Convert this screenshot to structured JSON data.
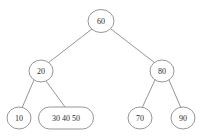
{
  "diagram": {
    "type": "tree",
    "canvas": {
      "width": 205,
      "height": 137
    },
    "colors": {
      "background": "#ffffff",
      "stroke": "#8a8a8a",
      "node_fill": "#ffffff",
      "text": "#2b2b2b"
    },
    "nodes": [
      {
        "id": "root",
        "shape": "circle",
        "label": "60",
        "keys": [
          "60"
        ],
        "cx": 101,
        "cy": 21,
        "rx": 13,
        "ry": 11.5,
        "level": 0
      },
      {
        "id": "n20",
        "shape": "circle",
        "label": "20",
        "keys": [
          "20"
        ],
        "cx": 41,
        "cy": 71,
        "rx": 12,
        "ry": 11,
        "level": 1
      },
      {
        "id": "n80",
        "shape": "circle",
        "label": "80",
        "keys": [
          "80"
        ],
        "cx": 162,
        "cy": 71,
        "rx": 12,
        "ry": 11,
        "level": 1
      },
      {
        "id": "n10",
        "shape": "circle",
        "label": "10",
        "keys": [
          "10"
        ],
        "cx": 19,
        "cy": 118,
        "rx": 12,
        "ry": 11,
        "level": 2
      },
      {
        "id": "n304050",
        "shape": "stadium",
        "label": "30  40  50",
        "keys": [
          "30",
          "40",
          "50"
        ],
        "cx": 66,
        "cy": 118,
        "rx": 27.5,
        "ry": 11,
        "level": 2
      },
      {
        "id": "n70",
        "shape": "circle",
        "label": "70",
        "keys": [
          "70"
        ],
        "cx": 140,
        "cy": 118,
        "rx": 12,
        "ry": 11,
        "level": 2
      },
      {
        "id": "n90",
        "shape": "circle",
        "label": "90",
        "keys": [
          "90"
        ],
        "cx": 183,
        "cy": 118,
        "rx": 12,
        "ry": 11,
        "level": 2
      }
    ],
    "edges": [
      {
        "id": "e-root-20",
        "from": "root",
        "to": "n20",
        "x1": 92,
        "y1": 29,
        "x2": 48,
        "y2": 63
      },
      {
        "id": "e-root-80",
        "from": "root",
        "to": "n80",
        "x1": 111,
        "y1": 29,
        "x2": 155,
        "y2": 63
      },
      {
        "id": "e-20-10",
        "from": "n20",
        "to": "n10",
        "x1": 34,
        "y1": 80,
        "x2": 22,
        "y2": 108
      },
      {
        "id": "e-20-304050",
        "from": "n20",
        "to": "n304050",
        "x1": 46,
        "y1": 81,
        "x2": 65,
        "y2": 107
      },
      {
        "id": "e-80-70",
        "from": "n80",
        "to": "n70",
        "x1": 155,
        "y1": 80,
        "x2": 142,
        "y2": 108
      },
      {
        "id": "e-80-90",
        "from": "n80",
        "to": "n90",
        "x1": 169,
        "y1": 80,
        "x2": 181,
        "y2": 108
      }
    ]
  }
}
